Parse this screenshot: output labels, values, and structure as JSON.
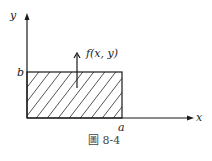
{
  "figure": {
    "caption": "圖 8-4",
    "axes": {
      "x_label": "x",
      "y_label": "y"
    },
    "region": {
      "x_extent_label": "a",
      "y_extent_label": "b",
      "fill": "hatched"
    },
    "vector_label": "f(x, y)"
  }
}
